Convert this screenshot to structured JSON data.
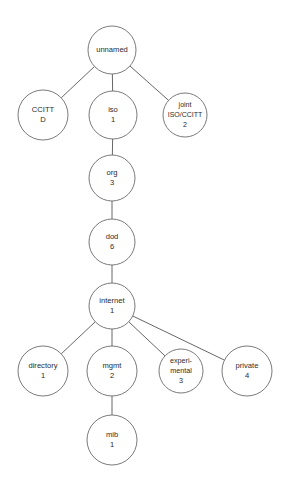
{
  "diagram": {
    "type": "tree",
    "canvas": {
      "width": 288,
      "height": 485,
      "background": "#ffffff"
    },
    "style": {
      "node_stroke": "#6b6b6b",
      "node_fill": "#ffffff",
      "edge_stroke": "#555555",
      "text_color": "#2b2b2b"
    },
    "nodes": [
      {
        "id": "unnamed",
        "lines": [
          "unnamed"
        ],
        "label": "unnamed",
        "number": "",
        "cx": 112,
        "cy": 50,
        "r": 24,
        "font_size": 7.6
      },
      {
        "id": "ccitt",
        "lines": [
          "CCITT",
          "D"
        ],
        "label": "CCITT",
        "number": "D",
        "cx": 43,
        "cy": 115,
        "r": 25,
        "font_size": 7.6
      },
      {
        "id": "iso",
        "lines": [
          "iso",
          "1"
        ],
        "label": "iso",
        "number": "1",
        "cx": 113,
        "cy": 115,
        "r": 24,
        "font_size": 7.6
      },
      {
        "id": "joint-iso-ccitt",
        "lines": [
          "joint",
          "ISO/CCITT",
          "2"
        ],
        "label": "joint ISO/CCITT",
        "number": "2",
        "cx": 185,
        "cy": 115,
        "r": 22,
        "font_size": 7.0
      },
      {
        "id": "org",
        "lines": [
          "org",
          "3"
        ],
        "label": "org",
        "number": "3",
        "cx": 112,
        "cy": 178,
        "r": 23,
        "font_size": 7.6
      },
      {
        "id": "dod",
        "lines": [
          "dod",
          "6"
        ],
        "label": "dod",
        "number": "6",
        "cx": 112,
        "cy": 242,
        "r": 23,
        "font_size": 7.6
      },
      {
        "id": "internet",
        "lines": [
          "internet",
          "1"
        ],
        "label": "internet",
        "number": "1",
        "cx": 112,
        "cy": 306,
        "r": 23,
        "font_size": 7.6
      },
      {
        "id": "directory",
        "lines": [
          "directory",
          "1"
        ],
        "label": "directory",
        "number": "1",
        "cx": 43,
        "cy": 371,
        "r": 25,
        "font_size": 7.6
      },
      {
        "id": "mgmt",
        "lines": [
          "mgmt",
          "2"
        ],
        "label": "mgmt",
        "number": "2",
        "cx": 112,
        "cy": 371,
        "r": 25,
        "font_size": 7.6
      },
      {
        "id": "experimental",
        "lines": [
          "experi-",
          "mental",
          "3"
        ],
        "label": "experimental",
        "number": "3",
        "cx": 181,
        "cy": 371,
        "r": 22,
        "font_size": 7.2
      },
      {
        "id": "private",
        "lines": [
          "private",
          "4"
        ],
        "label": "private",
        "number": "4",
        "cx": 247,
        "cy": 371,
        "r": 25,
        "font_size": 7.6
      },
      {
        "id": "mib",
        "lines": [
          "mib",
          "1"
        ],
        "label": "mib",
        "number": "1",
        "cx": 112,
        "cy": 440,
        "r": 25,
        "font_size": 7.6
      }
    ],
    "edges": [
      {
        "from": "unnamed",
        "to": "ccitt"
      },
      {
        "from": "unnamed",
        "to": "iso"
      },
      {
        "from": "unnamed",
        "to": "joint-iso-ccitt"
      },
      {
        "from": "iso",
        "to": "org"
      },
      {
        "from": "org",
        "to": "dod"
      },
      {
        "from": "dod",
        "to": "internet"
      },
      {
        "from": "internet",
        "to": "directory"
      },
      {
        "from": "internet",
        "to": "mgmt"
      },
      {
        "from": "internet",
        "to": "experimental"
      },
      {
        "from": "internet",
        "to": "private"
      },
      {
        "from": "mgmt",
        "to": "mib"
      }
    ]
  }
}
